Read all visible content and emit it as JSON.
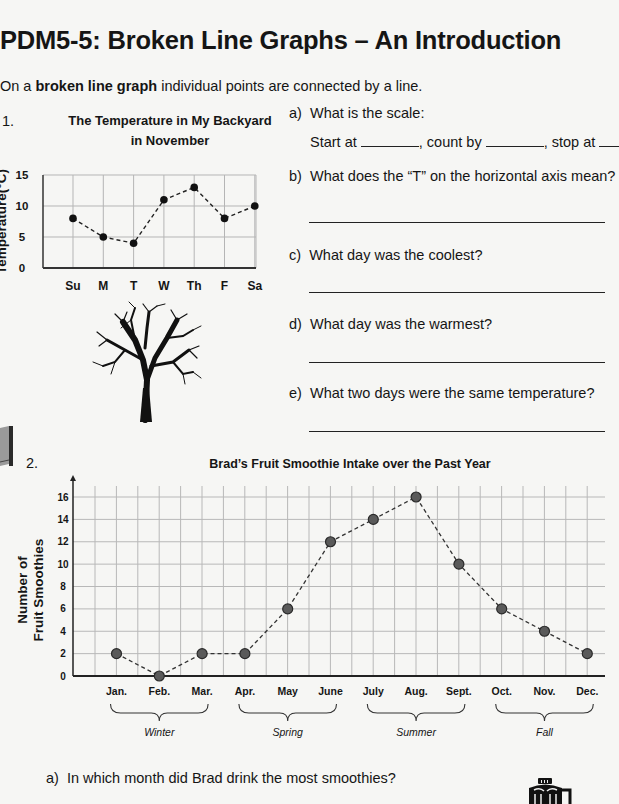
{
  "page": {
    "title": "PDM5-5: Broken Line Graphs – An Introduction",
    "intro_prefix": "On a ",
    "intro_bold": "broken line graph",
    "intro_suffix": " individual points are connected by a line."
  },
  "section1": {
    "number": "1.",
    "chart_title_line1": "The Temperature in My Backyard",
    "chart_title_line2": "in November",
    "y_label": "Temperature(°C)",
    "tree_icon": "tree-icon",
    "questions": {
      "a_label": "a)",
      "a_text": "What is the scale:",
      "a_start": "Start at",
      "a_count": ", count by",
      "a_stop": ", stop at",
      "b_label": "b)",
      "b_text": "What does the “T” on the horizontal axis mean?",
      "c_label": "c)",
      "c_text": "What day was the coolest?",
      "d_label": "d)",
      "d_text": "What day was the warmest?",
      "e_label": "e)",
      "e_text": "What two days were the same temperature?"
    }
  },
  "section2": {
    "number": "2.",
    "book_icon": "book-icon",
    "chart_title": "Brad’s Fruit Smoothie Intake over the Past Year",
    "y_label_line1": "Number of",
    "y_label_line2": "Fruit Smoothies",
    "seasons": [
      "Winter",
      "Spring",
      "Summer",
      "Fall"
    ],
    "question_a_label": "a)",
    "question_a_text": "In which month did Brad drink the most smoothies?",
    "blender_icon": "blender-icon"
  },
  "chart_data": [
    {
      "type": "line",
      "title": "The Temperature in My Backyard in November",
      "xlabel": "",
      "ylabel": "Temperature(°C)",
      "categories": [
        "Su",
        "M",
        "T",
        "W",
        "Th",
        "F",
        "Sa"
      ],
      "values": [
        8,
        5,
        4,
        11,
        13,
        8,
        10
      ],
      "yticks": [
        0,
        5,
        10,
        15
      ],
      "ylim": [
        0,
        15
      ],
      "grid": true,
      "line_style": "dashed",
      "legend": null
    },
    {
      "type": "line",
      "title": "Brad’s Fruit Smoothie Intake over the Past Year",
      "xlabel": "",
      "ylabel": "Number of Fruit Smoothies",
      "categories": [
        "Jan.",
        "Feb.",
        "Mar.",
        "Apr.",
        "May",
        "June",
        "July",
        "Aug.",
        "Sept.",
        "Oct.",
        "Nov.",
        "Dec."
      ],
      "values": [
        2,
        0,
        2,
        2,
        6,
        12,
        14,
        16,
        10,
        6,
        4,
        2
      ],
      "yticks": [
        0,
        2,
        4,
        6,
        8,
        10,
        12,
        14,
        16
      ],
      "ylim": [
        0,
        17
      ],
      "grid": true,
      "line_style": "dashed",
      "annotations": [
        {
          "label": "Winter",
          "spans": [
            "Jan.",
            "Mar."
          ]
        },
        {
          "label": "Spring",
          "spans": [
            "Apr.",
            "June"
          ]
        },
        {
          "label": "Summer",
          "spans": [
            "July",
            "Sept."
          ]
        },
        {
          "label": "Fall",
          "spans": [
            "Oct.",
            "Dec."
          ]
        }
      ],
      "legend": null
    }
  ]
}
